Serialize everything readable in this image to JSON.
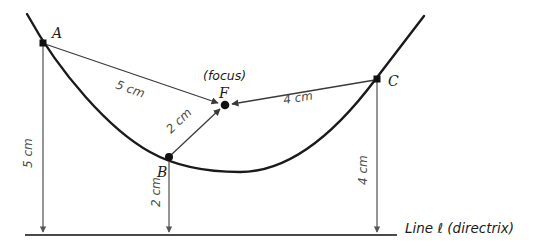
{
  "figure": {
    "colors": {
      "curve": "#1a1a1a",
      "segment": "#3a3a3a",
      "dimension": "#555555",
      "directrix": "#4a4a4a",
      "text": "#1a1a1a",
      "dim_text": "#4a4a4a",
      "background": "#ffffff"
    }
  },
  "points": {
    "A": {
      "label": "A",
      "x": 43,
      "y": 43,
      "label_x": 52,
      "label_y": 38
    },
    "B": {
      "label": "B",
      "x": 169,
      "y": 157,
      "label_x": 157,
      "label_y": 174
    },
    "C": {
      "label": "C",
      "x": 377,
      "y": 79,
      "label_x": 388,
      "label_y": 85
    },
    "F": {
      "label": "F",
      "x": 225,
      "y": 105,
      "label_x": 221,
      "label_y": 99
    }
  },
  "annotations": {
    "focus_note": "(focus)",
    "focus_note_x": 206,
    "focus_note_y": 78,
    "directrix_label": "Line ℓ (directrix)",
    "directrix_label_x": 405,
    "directrix_label_y": 232
  },
  "focal_segments": [
    {
      "name": "A-to-F",
      "label": "5 cm",
      "from": "A",
      "to": "F",
      "label_x": 118,
      "label_y": 83,
      "rotation": 24
    },
    {
      "name": "B-to-F",
      "label": "2 cm",
      "from": "B",
      "to": "F",
      "label_x": 180,
      "label_y": 127,
      "rotation": -41
    },
    {
      "name": "C-to-F",
      "label": "4 cm",
      "from": "C",
      "to": "F",
      "label_x": 289,
      "label_y": 102,
      "rotation": -10
    }
  ],
  "directrix_segments": [
    {
      "name": "A-to-directrix",
      "label": "5 cm",
      "from": "A",
      "x": 43,
      "y_top": 43,
      "y_bottom": 233,
      "label_x": 29,
      "label_y": 158,
      "rotation": -90
    },
    {
      "name": "B-to-directrix",
      "label": "2 cm",
      "from": "B",
      "x": 169,
      "y_top": 157,
      "y_bottom": 233,
      "label_x": 157,
      "label_y": 198,
      "rotation": -90
    },
    {
      "name": "C-to-directrix",
      "label": "4 cm",
      "from": "C",
      "x": 377,
      "y_top": 79,
      "y_bottom": 233,
      "label_x": 364,
      "label_y": 174,
      "rotation": -90
    }
  ],
  "directrix": {
    "name": "directrix-line",
    "x_start": 25,
    "x_end": 397,
    "y": 235
  },
  "parabola": {
    "name": "parabola-curve",
    "vertex_x": 240,
    "vertex_y": 172,
    "left_end_x": 27,
    "left_end_y": 14,
    "right_end_x": 424,
    "right_end_y": 16,
    "path": "M 27,14 C 60,74 110,130 150,152 C 175,166 205,172 240,172 C 285,172 330,140 375,80 C 395,54 412,32 424,16"
  }
}
